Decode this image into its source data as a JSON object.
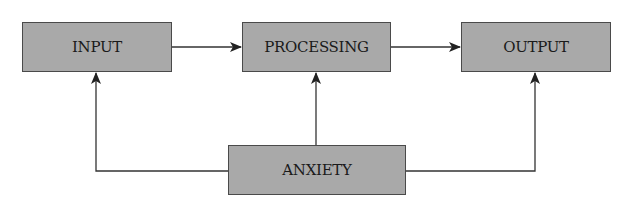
{
  "diagram": {
    "type": "flow",
    "nodes": [
      {
        "id": "input",
        "label": "INPUT"
      },
      {
        "id": "processing",
        "label": "PROCESSING"
      },
      {
        "id": "output",
        "label": "OUTPUT"
      },
      {
        "id": "anxiety",
        "label": "ANXIETY"
      }
    ],
    "edges": [
      {
        "from": "input",
        "to": "processing"
      },
      {
        "from": "processing",
        "to": "output"
      },
      {
        "from": "anxiety",
        "to": "input"
      },
      {
        "from": "anxiety",
        "to": "processing"
      },
      {
        "from": "anxiety",
        "to": "output"
      }
    ],
    "colors": {
      "box_fill": "#a9a9a9",
      "box_border": "#4a4a4a",
      "line": "#333333"
    }
  }
}
